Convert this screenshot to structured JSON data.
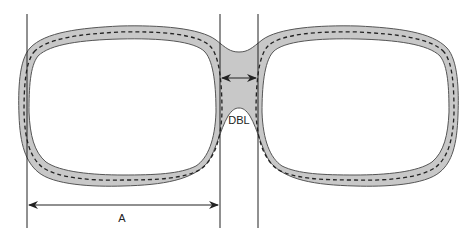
{
  "diagram": {
    "labels": {
      "a": "A",
      "dbl": "DBL"
    },
    "colors": {
      "frame_fill": "#c8c8c8",
      "frame_stroke": "#555555",
      "line": "#222222",
      "background": "#ffffff"
    },
    "measurements": [
      {
        "name": "A",
        "description": "horizontal lens width"
      },
      {
        "name": "DBL",
        "description": "distance between lenses"
      }
    ]
  }
}
